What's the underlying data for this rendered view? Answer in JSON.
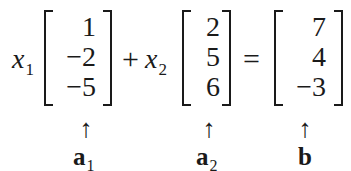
{
  "equation": {
    "coef1": {
      "var": "x",
      "sub": "1"
    },
    "plus": "+",
    "coef2": {
      "var": "x",
      "sub": "2"
    },
    "equals": "=",
    "vector_a1": {
      "entries": [
        "1",
        "−2",
        "−5"
      ],
      "label": "a",
      "label_sub": "1"
    },
    "vector_a2": {
      "entries": [
        "2",
        "5",
        "6"
      ],
      "label": "a",
      "label_sub": "2"
    },
    "vector_b": {
      "entries": [
        "7",
        "4",
        "−3"
      ],
      "label": "b",
      "label_sub": ""
    },
    "arrow": "↑"
  }
}
